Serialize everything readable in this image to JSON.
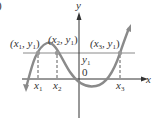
{
  "figure": {
    "corner_fragment": ")",
    "axes": {
      "x_label": "x",
      "y_label": "y",
      "origin_label": "0"
    },
    "horizontal_line_label": {
      "main": "y",
      "sub": "1"
    },
    "points": [
      {
        "label_open": "(x",
        "sub_x": "1",
        "mid": ", y",
        "sub_y": "1",
        "close": ")"
      },
      {
        "label_open": "(x",
        "sub_x": "2",
        "mid": ", y",
        "sub_y": "1",
        "close": ")"
      },
      {
        "label_open": "(x",
        "sub_x": "3",
        "mid": ", y",
        "sub_y": "1",
        "close": ")"
      }
    ],
    "x_ticks": [
      {
        "main": "x",
        "sub": "1"
      },
      {
        "main": "x",
        "sub": "2"
      },
      {
        "main": "x",
        "sub": "3"
      }
    ],
    "colors": {
      "curve": "#8a8a8a",
      "axes": "#333333",
      "line": "#8a8a8a",
      "dashes": "#333333",
      "points": "#999999"
    }
  }
}
